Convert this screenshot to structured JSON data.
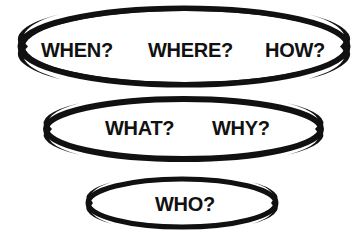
{
  "diagram": {
    "background_color": "#ffffff",
    "stroke_color": "#111111",
    "text_color": "#111111",
    "rows": [
      {
        "id": "row-1",
        "ellipse": {
          "cx": 184,
          "cy": 46.5,
          "rx": 164,
          "ry": 38.5,
          "stroke_width": 6
        },
        "labels": [
          {
            "id": "when",
            "text": "WHEN?"
          },
          {
            "id": "where",
            "text": "WHERE?"
          },
          {
            "id": "how",
            "text": "HOW?"
          }
        ]
      },
      {
        "id": "row-2",
        "ellipse": {
          "cx": 183.5,
          "cy": 129,
          "rx": 138.5,
          "ry": 31,
          "stroke_width": 5.5
        },
        "labels": [
          {
            "id": "what",
            "text": "WHAT?"
          },
          {
            "id": "why",
            "text": "WHY?"
          }
        ]
      },
      {
        "id": "row-3",
        "ellipse": {
          "cx": 182,
          "cy": 203,
          "rx": 95,
          "ry": 25,
          "stroke_width": 5
        },
        "labels": [
          {
            "id": "who",
            "text": "WHO?"
          }
        ]
      }
    ]
  },
  "labels": {
    "when": "WHEN?",
    "where": "WHERE?",
    "how": "HOW?",
    "what": "WHAT?",
    "why": "WHY?",
    "who": "WHO?"
  }
}
